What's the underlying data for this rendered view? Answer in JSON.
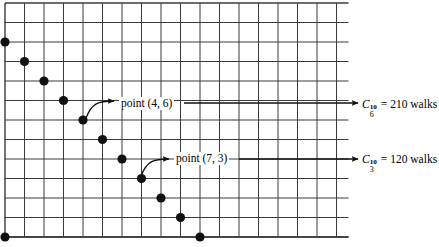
{
  "figure": {
    "type": "lattice-path-diagram",
    "width": 439,
    "height": 247,
    "background_color": "#ffffff",
    "line_color": "#3a3a3a",
    "dot_color": "#111111",
    "text_color": "#000000"
  },
  "grid": {
    "origin_x": 5,
    "origin_y": 3,
    "cell_width": 19.5,
    "cell_height": 19.5,
    "columns": 17,
    "rows": 12,
    "right_edge": 348.5,
    "bottom_edge": 237
  },
  "points": [
    {
      "x": 5,
      "y": 42
    },
    {
      "x": 24.5,
      "y": 61.5
    },
    {
      "x": 44,
      "y": 81
    },
    {
      "x": 63.5,
      "y": 100.5
    },
    {
      "x": 83,
      "y": 120
    },
    {
      "x": 102.5,
      "y": 139.5
    },
    {
      "x": 122,
      "y": 159
    },
    {
      "x": 141.5,
      "y": 178.5
    },
    {
      "x": 161,
      "y": 198
    },
    {
      "x": 180.5,
      "y": 217.5
    },
    {
      "x": 200,
      "y": 237
    },
    {
      "x": 5,
      "y": 237
    }
  ],
  "dot_radius": 4.6,
  "annotations": [
    {
      "id": "annotation-point-4-6",
      "label": "point (4, 6)",
      "label_x": 119,
      "label_y": 97,
      "curve": {
        "start_x": 86,
        "start_y": 118,
        "c1_x": 92,
        "c1_y": 103,
        "c2_x": 98,
        "c2_y": 101,
        "end_x": 114,
        "end_y": 101
      },
      "lead_line": {
        "from_x": 184,
        "from_y": 103,
        "to_x": 358,
        "to_y": 103
      },
      "target_point_index": 4
    },
    {
      "id": "annotation-point-7-3",
      "label": "point (7, 3)",
      "label_x": 174,
      "label_y": 152,
      "curve": {
        "start_x": 141,
        "start_y": 176,
        "c1_x": 147,
        "c1_y": 161,
        "c2_x": 153,
        "c2_y": 159,
        "end_x": 169,
        "end_y": 159
      },
      "lead_line": {
        "from_x": 239,
        "from_y": 159,
        "to_x": 358,
        "to_y": 159
      },
      "target_point_index": 7
    }
  ],
  "results": [
    {
      "id": "result-c-6-10",
      "symbol": "C",
      "superscript": "10",
      "subscript": "6",
      "equals": "=",
      "value": "210",
      "unit": "walks",
      "full_text": "C_6^10 = 210 walks"
    },
    {
      "id": "result-c-3-10",
      "symbol": "C",
      "superscript": "10",
      "subscript": "3",
      "equals": "=",
      "value": "120",
      "unit": "walks",
      "full_text": "C_3^10 = 120 walks"
    }
  ]
}
